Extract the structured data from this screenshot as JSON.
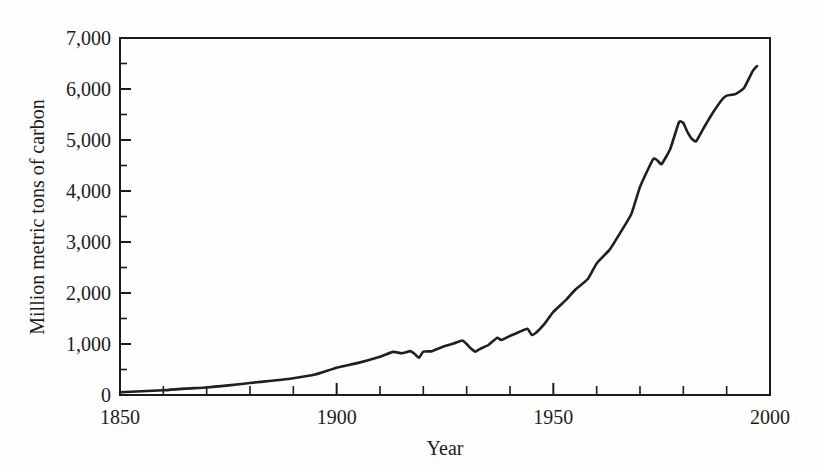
{
  "chart_data": {
    "type": "line",
    "title": "",
    "subtitle": "",
    "xlabel": "Year",
    "ylabel": "Million metric tons of carbon",
    "xlim": [
      1850,
      2000
    ],
    "ylim": [
      0,
      7000
    ],
    "grid": false,
    "legend": null,
    "legend_position": "none",
    "x_ticks_major": [
      1850,
      1900,
      1950,
      2000
    ],
    "x_tick_labels": [
      "1850",
      "1900",
      "1950",
      "2000"
    ],
    "x_ticks_minor_step": 10,
    "y_ticks_major": [
      0,
      1000,
      2000,
      3000,
      4000,
      5000,
      6000,
      7000
    ],
    "y_tick_labels": [
      "0",
      "1,000",
      "2,000",
      "3,000",
      "4,000",
      "5,000",
      "6,000",
      "7,000"
    ],
    "y_ticks_minor_step": 500,
    "series": [
      {
        "name": "Global carbon emissions from fossil fuels",
        "color": "#1f1f1f",
        "x": [
          1850,
          1855,
          1860,
          1865,
          1870,
          1875,
          1880,
          1885,
          1890,
          1895,
          1900,
          1905,
          1910,
          1913,
          1915,
          1917,
          1918,
          1919,
          1920,
          1922,
          1925,
          1927,
          1929,
          1930,
          1931,
          1932,
          1933,
          1935,
          1937,
          1938,
          1940,
          1942,
          1944,
          1945,
          1946,
          1948,
          1950,
          1953,
          1955,
          1958,
          1960,
          1963,
          1965,
          1968,
          1970,
          1973,
          1974,
          1975,
          1977,
          1979,
          1980,
          1981,
          1982,
          1983,
          1985,
          1987,
          1989,
          1990,
          1992,
          1994,
          1996,
          1997
        ],
        "values": [
          54,
          75,
          92,
          125,
          147,
          188,
          236,
          280,
          330,
          400,
          534,
          630,
          750,
          845,
          820,
          860,
          805,
          730,
          850,
          860,
          960,
          1010,
          1070,
          1000,
          910,
          850,
          900,
          980,
          1120,
          1080,
          1160,
          1230,
          1300,
          1180,
          1220,
          1400,
          1630,
          1870,
          2060,
          2280,
          2580,
          2850,
          3120,
          3550,
          4080,
          4620,
          4600,
          4530,
          4830,
          5350,
          5330,
          5150,
          5020,
          4980,
          5280,
          5560,
          5800,
          5870,
          5900,
          6020,
          6350,
          6450
        ]
      }
    ]
  },
  "axes": {
    "y_axis_label": "Million metric tons of carbon",
    "x_axis_label": "Year"
  }
}
